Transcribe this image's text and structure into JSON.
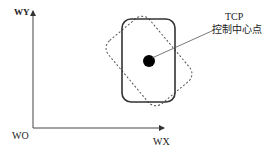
{
  "axes": {
    "y_label": "WY",
    "x_label": "WX",
    "origin_label": "WO"
  },
  "annotation": {
    "line1": "TCP",
    "line2": "控制中心点"
  },
  "shapes": {
    "solid_rect": "upright rounded rectangle (solid outline)",
    "dashed_rect": "rotated rounded rectangle (dashed outline)",
    "center_point": "filled black circle"
  },
  "colors": {
    "stroke": "#333333",
    "dot": "#000000",
    "background": "#ffffff"
  }
}
